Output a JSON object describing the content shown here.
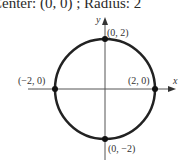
{
  "caption": "Center: (0, 0) ; Radius: 2",
  "axes": {
    "x_label": "x",
    "y_label": "y"
  },
  "points": [
    {
      "label": "(0, 2)",
      "x": 0,
      "y": 2
    },
    {
      "label": "(2, 0)",
      "x": 2,
      "y": 0
    },
    {
      "label": "(−2, 0)",
      "x": -2,
      "y": 0
    },
    {
      "label": "(0, −2)",
      "x": 0,
      "y": -2
    }
  ],
  "circle": {
    "center": [
      0,
      0
    ],
    "radius": 2,
    "color": "#222222"
  }
}
